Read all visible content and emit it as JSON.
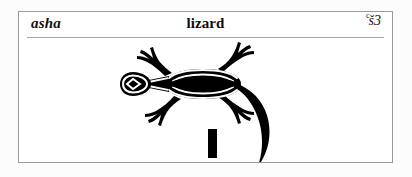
{
  "card": {
    "headword": "asha",
    "gloss": "lizard",
    "transliteration": {
      "full": "ꜥš3",
      "superscript": "c",
      "base": "š3"
    }
  },
  "figure": {
    "subject": "lizard",
    "style": "black-and-white stylized top-view line drawing",
    "scale_bar": {
      "label": "",
      "orientation": "vertical"
    },
    "colors": {
      "ink": "#000000",
      "paper": "#ffffff"
    }
  },
  "page": {
    "background": "#fcfcfc",
    "border_color": "#9a9a9a",
    "rule_color": "#a8a8a8"
  }
}
